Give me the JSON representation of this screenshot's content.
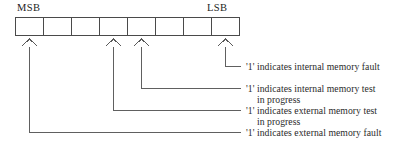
{
  "diagram": {
    "bit_count": 8,
    "msb_label": "MSB",
    "lsb_label": "LSB",
    "line_color": "#555555",
    "text_color": "#2b2b2b",
    "box_border_color": "#4a4a4a",
    "bits": [
      {
        "index": 0,
        "position": "MSB",
        "value": "",
        "marker": "caret-up"
      },
      {
        "index": 1,
        "position": "",
        "value": "",
        "marker": ""
      },
      {
        "index": 2,
        "position": "",
        "value": "",
        "marker": ""
      },
      {
        "index": 3,
        "position": "",
        "value": "",
        "marker": "caret-up"
      },
      {
        "index": 4,
        "position": "",
        "value": "",
        "marker": "caret-up"
      },
      {
        "index": 5,
        "position": "",
        "value": "",
        "marker": ""
      },
      {
        "index": 6,
        "position": "",
        "value": "",
        "marker": ""
      },
      {
        "index": 7,
        "position": "LSB",
        "value": "",
        "marker": "caret-up"
      }
    ],
    "annotations": [
      {
        "bit_index": 7,
        "line1": "'1' indicates internal memory fault",
        "line2": ""
      },
      {
        "bit_index": 4,
        "line1": "'1' indicates internal memory test",
        "line2": "in progress"
      },
      {
        "bit_index": 3,
        "line1": "'1' indicates external memory test",
        "line2": "in progress"
      },
      {
        "bit_index": 0,
        "line1": "'1' indicates external memory fault",
        "line2": ""
      }
    ]
  }
}
